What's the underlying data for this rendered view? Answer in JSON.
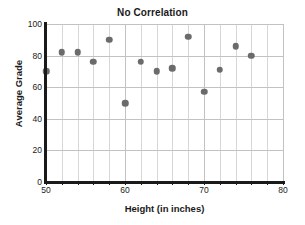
{
  "chart_data": {
    "type": "scatter",
    "title": "No Correlation",
    "xlabel": "Height (in inches)",
    "ylabel": "Average Grade",
    "xlim": [
      50,
      80
    ],
    "ylim": [
      0,
      100
    ],
    "x_ticks": [
      50,
      60,
      70,
      80
    ],
    "y_ticks": [
      0,
      20,
      40,
      60,
      80,
      100
    ],
    "x_minor_step": 2,
    "y_minor_step": 20,
    "grid": true,
    "legend": null,
    "point_color": "#6b6b6b",
    "axis_color": "#1a1a1a",
    "grid_color": "#d8d8d8",
    "points": [
      {
        "x": 50,
        "y": 70
      },
      {
        "x": 52,
        "y": 82
      },
      {
        "x": 54,
        "y": 82
      },
      {
        "x": 56,
        "y": 76
      },
      {
        "x": 58,
        "y": 90
      },
      {
        "x": 60,
        "y": 50
      },
      {
        "x": 62,
        "y": 76
      },
      {
        "x": 64,
        "y": 70
      },
      {
        "x": 66,
        "y": 72
      },
      {
        "x": 68,
        "y": 92
      },
      {
        "x": 70,
        "y": 57
      },
      {
        "x": 72,
        "y": 71
      },
      {
        "x": 74,
        "y": 86
      },
      {
        "x": 76,
        "y": 80
      }
    ]
  }
}
